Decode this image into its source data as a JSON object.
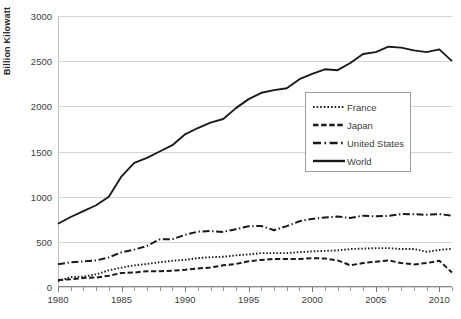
{
  "chart_data": {
    "type": "line",
    "title": "",
    "xlabel": "",
    "ylabel": "Billion Kilowatt",
    "xlim": [
      1980,
      2011
    ],
    "ylim": [
      0,
      3000
    ],
    "yticks": [
      0,
      500,
      1000,
      1500,
      2000,
      2500,
      3000
    ],
    "xticks": [
      1980,
      1985,
      1990,
      1995,
      2000,
      2005,
      2010
    ],
    "grid": true,
    "legend_position": "center-right",
    "x": [
      1980,
      1981,
      1982,
      1983,
      1984,
      1985,
      1986,
      1987,
      1988,
      1989,
      1990,
      1991,
      1992,
      1993,
      1994,
      1995,
      1996,
      1997,
      1998,
      1999,
      2000,
      2001,
      2002,
      2003,
      2004,
      2005,
      2006,
      2007,
      2008,
      2009,
      2010,
      2011
    ],
    "series": [
      {
        "name": "France",
        "style": "dotted",
        "values": [
          65,
          110,
          115,
          140,
          185,
          215,
          240,
          255,
          275,
          290,
          300,
          320,
          330,
          335,
          350,
          360,
          375,
          375,
          375,
          385,
          395,
          400,
          405,
          420,
          425,
          430,
          430,
          420,
          420,
          390,
          410,
          423
        ]
      },
      {
        "name": "Japan",
        "style": "dashed",
        "values": [
          78,
          85,
          100,
          105,
          125,
          155,
          160,
          175,
          175,
          180,
          190,
          205,
          215,
          240,
          255,
          285,
          300,
          310,
          310,
          310,
          320,
          315,
          295,
          240,
          265,
          280,
          295,
          265,
          250,
          265,
          290,
          160
        ]
      },
      {
        "name": "United States",
        "style": "dash-dot",
        "values": [
          251,
          273,
          283,
          294,
          328,
          384,
          414,
          455,
          527,
          529,
          577,
          613,
          619,
          610,
          640,
          673,
          675,
          629,
          674,
          728,
          754,
          769,
          780,
          764,
          789,
          782,
          787,
          807,
          806,
          799,
          807,
          790
        ]
      },
      {
        "name": "World",
        "style": "solid",
        "values": [
          700,
          775,
          840,
          905,
          1000,
          1225,
          1375,
          1430,
          1500,
          1570,
          1690,
          1760,
          1820,
          1860,
          1980,
          2080,
          2150,
          2180,
          2200,
          2300,
          2360,
          2410,
          2400,
          2480,
          2580,
          2600,
          2660,
          2650,
          2620,
          2600,
          2630,
          2500
        ]
      }
    ]
  },
  "axis": {
    "y_title": "Billion Kilowatt",
    "y_tick_labels": [
      "0",
      "500",
      "1000",
      "1500",
      "2000",
      "2500",
      "3000"
    ],
    "x_tick_labels": [
      "1980",
      "1985",
      "1990",
      "1995",
      "2000",
      "2005",
      "2010"
    ]
  },
  "legend": {
    "items": [
      {
        "label": "France",
        "key": "dotted-line-key"
      },
      {
        "label": "Japan",
        "key": "dashed-line-key"
      },
      {
        "label": "United States",
        "key": "dash-dot-line-key"
      },
      {
        "label": "World",
        "key": "solid-line-key"
      }
    ]
  }
}
